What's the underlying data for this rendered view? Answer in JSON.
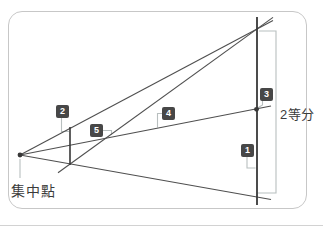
{
  "figure": {
    "vanishing_point": {
      "label": "集中點"
    },
    "bisection": {
      "label": "2等分"
    },
    "steps": [
      {
        "number": "1"
      },
      {
        "number": "2"
      },
      {
        "number": "3"
      },
      {
        "number": "4"
      },
      {
        "number": "5"
      }
    ],
    "colors": {
      "line": "#4f4f4f",
      "line_dark": "#383838",
      "leader": "#b8bfbf",
      "marker_bg": "#474747",
      "marker_text": "#ffffff",
      "frame_border": "#c7c7c7",
      "text": "#3b3b3b"
    }
  }
}
